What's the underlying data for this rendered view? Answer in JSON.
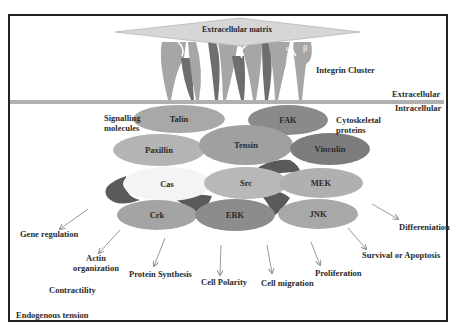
{
  "extracellular_matrix": "Extracellular matrix",
  "integrin": {
    "label": "Integrin Cluster",
    "alpha": "α",
    "beta": "β"
  },
  "membrane": {
    "outside": "Extracellular",
    "inside": "Intracellular"
  },
  "groups": {
    "signalling": "Signalling molecules",
    "signalling_line1": "Signalling",
    "signalling_line2": "molecules",
    "cytoskeletal_line1": "Cytoskeletal",
    "cytoskeletal_line2": "proteins"
  },
  "proteins": [
    {
      "id": "talin",
      "label": "Talin",
      "color": "#a8a8a8"
    },
    {
      "id": "fak",
      "label": "FAK",
      "color": "#8a8a8a"
    },
    {
      "id": "paxillin",
      "label": "Paxillin",
      "color": "#b4b4b4"
    },
    {
      "id": "tensin",
      "label": "Tensin",
      "color": "#a0a0a0"
    },
    {
      "id": "vinculin",
      "label": "Vinculin",
      "color": "#7c7c7c"
    },
    {
      "id": "cas",
      "label": "Cas",
      "color": "#f4f4f4"
    },
    {
      "id": "src",
      "label": "Src",
      "color": "#b8b8b8"
    },
    {
      "id": "mek",
      "label": "MEK",
      "color": "#b0b0b0"
    },
    {
      "id": "crk",
      "label": "Crk",
      "color": "#a4a4a4"
    },
    {
      "id": "erk",
      "label": "ERK",
      "color": "#8c8c8c"
    },
    {
      "id": "jnk",
      "label": "JNK",
      "color": "#a8a8a8"
    }
  ],
  "outcomes": [
    {
      "id": "gene-regulation",
      "label": "Gene regulation"
    },
    {
      "id": "actin-organization",
      "line1": "Actin",
      "line2": "organization"
    },
    {
      "id": "protein-synthesis",
      "label": "Protein Synthesis"
    },
    {
      "id": "cell-polarity",
      "label": "Cell Polarity"
    },
    {
      "id": "cell-migration",
      "label": "Cell migration"
    },
    {
      "id": "proliferation",
      "label": "Proliferation"
    },
    {
      "id": "survival-apoptosis",
      "label": "Survival or Apoptosis"
    },
    {
      "id": "differentiation",
      "label": "Differeniation"
    }
  ],
  "bottom_left": {
    "contractility": "Contractility",
    "endogenous_tension": "Endogenous tension"
  },
  "colors": {
    "membrane": "#b0b0b0",
    "integrin_light": "#a6a6a6",
    "integrin_dark": "#6e6e6e",
    "ecm": "#d6d6d6",
    "dark_gap": "#5a5a5a",
    "arrow": "#9a9a9a",
    "border": "#222222"
  }
}
